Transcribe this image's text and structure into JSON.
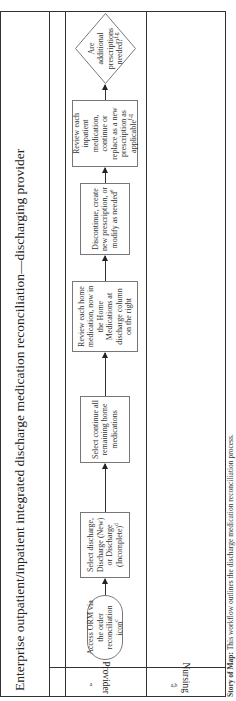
{
  "diagram": {
    "title": "Enterprise outpatient/inpatient integrated discharge medication reconciliation—discharging provider",
    "lanes": [
      {
        "label": "Provider",
        "superscript": "a"
      },
      {
        "label": "Nursing",
        "superscript": "a,b"
      }
    ],
    "nodes": [
      {
        "id": "n1",
        "shape": "oval",
        "text": "Access ORM via the order reconciliation icon",
        "superscript": "c"
      },
      {
        "id": "n2",
        "shape": "rect",
        "text": "Select discharge, Discharge (New) or Discharge (Incomplete)",
        "superscript": "d"
      },
      {
        "id": "n3",
        "shape": "rect",
        "text": "Select continue all remaining home medications",
        "superscript": ""
      },
      {
        "id": "n4",
        "shape": "rect",
        "text": "Review each home medication, now in the Home Medications at discharge column on the right",
        "superscript": ""
      },
      {
        "id": "n5",
        "shape": "rect",
        "text": "Discontinue, create new prescription, or modify as needed",
        "superscript": "e"
      },
      {
        "id": "n6",
        "shape": "rect",
        "text": "Review each inpatient medication, continue or replace as a new prescription as applicable",
        "superscript": "f,g"
      },
      {
        "id": "n7",
        "shape": "diamond",
        "text": "Are additional prescriptions needed?",
        "superscript": "f,g"
      }
    ],
    "edges": [
      [
        "n1",
        "n2"
      ],
      [
        "n2",
        "n3"
      ],
      [
        "n3",
        "n4"
      ],
      [
        "n4",
        "n5"
      ],
      [
        "n5",
        "n6"
      ],
      [
        "n6",
        "n7"
      ]
    ],
    "caption": {
      "lead": "Story of Map",
      "text": "This workflow outlines the discharge medication reconciliation process."
    },
    "colors": {
      "line": "#333333",
      "box_border": "#777777",
      "text": "#222222",
      "background": "#ffffff"
    }
  }
}
